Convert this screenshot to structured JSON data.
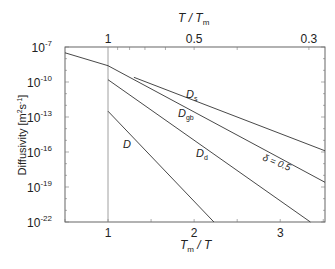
{
  "chart_data": {
    "type": "line",
    "title": "",
    "xlabel": "Tm / T",
    "xlabel_main": "T",
    "xlabel_sub": "m",
    "top_xlabel": "T / Tm",
    "ylabel": "Diffusivity [m2s-1]",
    "ylabel_text": "Diffusivity [m",
    "ylabel_units": "s",
    "ylabel_exp1": "2",
    "ylabel_exp2": "-1",
    "ylabel_close": "]",
    "yscale": "log",
    "xlim": [
      0.5,
      3.52
    ],
    "ylim": [
      1e-22,
      1e-07
    ],
    "x_ticks": [
      {
        "value": 1,
        "label": "1"
      },
      {
        "value": 2,
        "label": "2"
      },
      {
        "value": 3,
        "label": "3"
      }
    ],
    "top_ticks": [
      {
        "value": 1,
        "label": "1"
      },
      {
        "value": 2,
        "label": "0.5"
      },
      {
        "value": 3.333,
        "label": "0.3"
      }
    ],
    "y_ticks": [
      {
        "exp": -7,
        "base": "10",
        "label": "-7"
      },
      {
        "exp": -10,
        "base": "10",
        "label": "-10"
      },
      {
        "exp": -13,
        "base": "10",
        "label": "-13"
      },
      {
        "exp": -16,
        "base": "10",
        "label": "-16"
      },
      {
        "exp": -19,
        "base": "10",
        "label": "-19"
      },
      {
        "exp": -22,
        "base": "10",
        "label": "-22"
      }
    ],
    "grid": false,
    "melting_line_x": 1,
    "series": [
      {
        "name": "liquid",
        "label": "",
        "x": [
          0.5,
          1.0
        ],
        "log10_y": [
          -7.5,
          -8.6
        ]
      },
      {
        "name": "Ds",
        "label": "D",
        "sub": "s",
        "x": [
          1.3,
          3.52
        ],
        "log10_y": [
          -9.6,
          -15.9
        ]
      },
      {
        "name": "Dgb",
        "label": "D",
        "sub": "gb",
        "x": [
          1.0,
          3.52
        ],
        "log10_y": [
          -8.6,
          -18.6
        ]
      },
      {
        "name": "Dd",
        "label": "D",
        "sub": "d",
        "x": [
          1.0,
          3.35
        ],
        "log10_y": [
          -9.8,
          -22.0
        ]
      },
      {
        "name": "D",
        "label": "D",
        "sub": "",
        "x": [
          1.0,
          2.23
        ],
        "log10_y": [
          -12.5,
          -22.0
        ]
      }
    ],
    "annotations": [
      {
        "text": "δ = 0.5",
        "near_series": "Dgb",
        "rotation_deg": 22
      }
    ]
  }
}
